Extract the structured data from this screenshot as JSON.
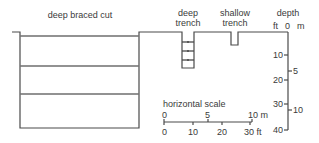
{
  "labels": {
    "deep_braced_cut": "deep braced cut",
    "deep_trench_line1": "deep",
    "deep_trench_line2": "trench",
    "shallow_trench_line1": "shallow",
    "shallow_trench_line2": "trench",
    "depth": "depth"
  },
  "depth_axis": {
    "unit_ft": "ft",
    "unit_m": "m",
    "zero": "0",
    "ft_ticks": [
      "10",
      "20",
      "30",
      "40"
    ],
    "m_ticks": [
      "5",
      "10"
    ]
  },
  "horizontal_scale": {
    "title": "horizontal scale",
    "m_ticks": [
      "0",
      "5",
      "10 m"
    ],
    "ft_ticks": [
      "0",
      "10",
      "20",
      "30 ft"
    ]
  },
  "colors": {
    "line": "#4a4a4a",
    "strut": "#8a8a8a"
  }
}
